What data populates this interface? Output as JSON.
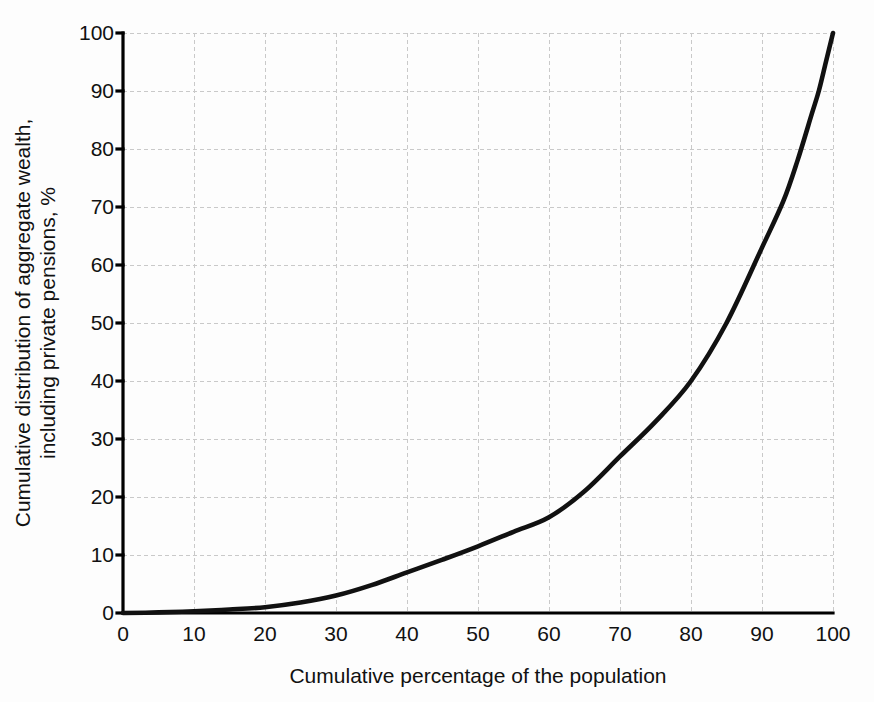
{
  "chart_data": {
    "type": "line",
    "title": "",
    "subtitle": "",
    "xlabel": "Cumulative percentage of the population",
    "ylabel": "Cumulative distribution of aggregate wealth, including private pensions, %",
    "ylabel_line1": "Cumulative distribution of aggregate wealth,",
    "ylabel_line2": "including private pensions, %",
    "xlim": [
      0,
      100
    ],
    "ylim": [
      0,
      100
    ],
    "xticks": [
      "0",
      "10",
      "20",
      "30",
      "40",
      "50",
      "60",
      "70",
      "80",
      "90",
      "100"
    ],
    "yticks": [
      "0",
      "10",
      "20",
      "30",
      "40",
      "50",
      "60",
      "70",
      "80",
      "90",
      "100"
    ],
    "xtick_values": [
      0,
      10,
      20,
      30,
      40,
      50,
      60,
      70,
      80,
      90,
      100
    ],
    "ytick_values": [
      0,
      10,
      20,
      30,
      40,
      50,
      60,
      70,
      80,
      90,
      100
    ],
    "grid": true,
    "grid_style": "dashed",
    "legend": false,
    "legend_position": "none",
    "series": [
      {
        "name": "Lorenz curve of wealth",
        "x": [
          0,
          5,
          10,
          15,
          20,
          25,
          30,
          35,
          40,
          45,
          50,
          55,
          60,
          65,
          70,
          75,
          80,
          85,
          90,
          93,
          95,
          97,
          98,
          99,
          100
        ],
        "values": [
          0,
          0.1,
          0.3,
          0.6,
          1.0,
          1.8,
          3.0,
          4.8,
          7.0,
          9.2,
          11.5,
          14.0,
          16.5,
          21.0,
          27.0,
          33.0,
          40.0,
          50.0,
          63.0,
          71.0,
          78.0,
          86.0,
          90.0,
          95.0,
          100.0
        ]
      }
    ],
    "colors": {
      "curve": "#111111",
      "axis": "#000000",
      "grid": "#c9c9c9",
      "background": "#fdfdfd",
      "text": "#111111"
    }
  },
  "plot_geometry": {
    "left": 123,
    "right": 833,
    "top": 33,
    "bottom": 613
  }
}
